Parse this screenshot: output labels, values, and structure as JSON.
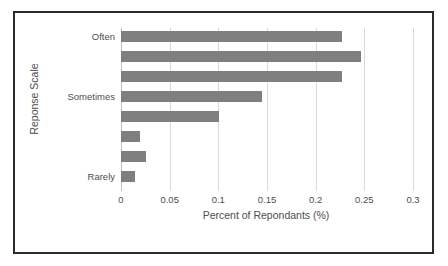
{
  "chart_data": {
    "type": "bar",
    "orientation": "horizontal",
    "title": "",
    "xlabel": "Percent of Repondants (%)",
    "ylabel": "Reponse Scale",
    "xlim": [
      0,
      0.3
    ],
    "xticks": [
      "0",
      "0.05",
      "0.1",
      "0.15",
      "0.2",
      "0.25",
      "0.3"
    ],
    "xtick_values": [
      0,
      0.05,
      0.1,
      0.15,
      0.2,
      0.25,
      0.3
    ],
    "grid": "vertical",
    "legend": "none",
    "bar_color": "#7f7f7f",
    "categories": [
      "Often",
      "",
      "",
      "Sometimes",
      "",
      "",
      "",
      "Rarely"
    ],
    "values": [
      0.227,
      0.247,
      0.227,
      0.145,
      0.101,
      0.02,
      0.026,
      0.014
    ],
    "bars": [
      {
        "label": "Often",
        "value": 0.227
      },
      {
        "label": "",
        "value": 0.247
      },
      {
        "label": "",
        "value": 0.227
      },
      {
        "label": "Sometimes",
        "value": 0.145
      },
      {
        "label": "",
        "value": 0.101
      },
      {
        "label": "",
        "value": 0.02
      },
      {
        "label": "",
        "value": 0.026
      },
      {
        "label": "Rarely",
        "value": 0.014
      }
    ]
  },
  "frame": {
    "border_color": "#2b2b2b",
    "background": "#ffffff"
  }
}
